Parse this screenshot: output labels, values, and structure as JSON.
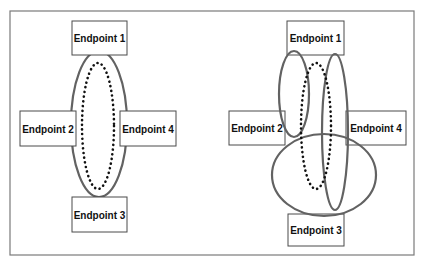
{
  "figure": {
    "frame": {
      "x": 10,
      "y": 11,
      "w": 404,
      "h": 244
    },
    "colors": {
      "solid_ellipse": "#626262",
      "dotted_ellipse": "#111111",
      "box_border": "#4a4a4a",
      "frame": "#7a7a7a"
    },
    "left_diagram": {
      "endpoints": [
        {
          "label": "Endpoint 1",
          "x": 72,
          "y": 21,
          "w": 55,
          "h": 34
        },
        {
          "label": "Endpoint 2",
          "x": 20,
          "y": 111,
          "w": 56,
          "h": 35
        },
        {
          "label": "Endpoint 4",
          "x": 120,
          "y": 111,
          "w": 56,
          "h": 35
        },
        {
          "label": "Endpoint 3",
          "x": 72,
          "y": 197,
          "w": 55,
          "h": 35
        }
      ],
      "solid_ellipses": [
        {
          "cx": 99,
          "cy": 124,
          "rx": 28,
          "ry": 73
        }
      ],
      "dotted_ellipse": {
        "cx": 98,
        "cy": 126,
        "rx": 16,
        "ry": 63
      }
    },
    "right_diagram": {
      "endpoints": [
        {
          "label": "Endpoint 1",
          "x": 287,
          "y": 21,
          "w": 57,
          "h": 34
        },
        {
          "label": "Endpoint 2",
          "x": 229,
          "y": 111,
          "w": 56,
          "h": 34
        },
        {
          "label": "Endpoint 4",
          "x": 346,
          "y": 111,
          "w": 60,
          "h": 34
        },
        {
          "label": "Endpoint 3",
          "x": 288,
          "y": 214,
          "w": 56,
          "h": 32
        }
      ],
      "solid_ellipses": [
        {
          "cx": 294,
          "cy": 94,
          "rx": 15,
          "ry": 43
        },
        {
          "cx": 335,
          "cy": 132,
          "rx": 13,
          "ry": 78
        },
        {
          "cx": 324,
          "cy": 175,
          "rx": 52,
          "ry": 41
        }
      ],
      "dotted_ellipse": {
        "cx": 316,
        "cy": 126,
        "rx": 15,
        "ry": 63
      }
    }
  }
}
